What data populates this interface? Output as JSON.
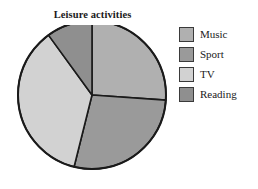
{
  "chart_data": {
    "type": "pie",
    "title": "Leisure activities",
    "xlabel": "",
    "ylabel": "",
    "legend_position": "right",
    "grid": false,
    "categories": [
      "Music",
      "Sport",
      "TV",
      "Reading"
    ],
    "values": [
      26,
      28,
      36,
      10
    ],
    "unit": "percent",
    "start_angle_deg": 0,
    "direction": "clockwise",
    "slices": [
      {
        "label": "Music",
        "value": 26,
        "angle_deg": 94,
        "color": "#b0b0b0"
      },
      {
        "label": "Sport",
        "value": 28,
        "angle_deg": 100,
        "color": "#9a9a9a"
      },
      {
        "label": "TV",
        "value": 36,
        "angle_deg": 130,
        "color": "#d2d2d2"
      },
      {
        "label": "Reading",
        "value": 10,
        "angle_deg": 36,
        "color": "#8f8f8f"
      }
    ]
  },
  "chart": {
    "title": "Leisure activities",
    "outline_color": "#1a1a1a"
  },
  "legend": {
    "items": [
      {
        "label": "Music",
        "color": "#b0b0b0"
      },
      {
        "label": "Sport",
        "color": "#9a9a9a"
      },
      {
        "label": "TV",
        "color": "#d2d2d2"
      },
      {
        "label": "Reading",
        "color": "#8f8f8f"
      }
    ]
  }
}
